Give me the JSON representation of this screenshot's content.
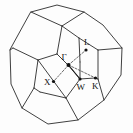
{
  "figure": {
    "name": "brillouin-zone-truncated-octahedron",
    "background_color": "#fdfdfd",
    "line_color": "#2a2a2a",
    "label_color": "#101010",
    "dash_color": "#3a3a3a"
  },
  "symmetry_points": [
    {
      "id": "gamma",
      "label": "Γ",
      "point_x": 68.5,
      "point_y": 65.0,
      "label_x": 61.5,
      "label_y": 60.0
    },
    {
      "id": "L",
      "label": "L",
      "point_x": 86.0,
      "point_y": 50.0,
      "label_x": 84.0,
      "label_y": 45.0
    },
    {
      "id": "X",
      "label": "X",
      "point_x": 53.5,
      "point_y": 81.5,
      "label_x": 44.0,
      "label_y": 84.5
    },
    {
      "id": "W",
      "label": "W",
      "point_x": 80.0,
      "point_y": 79.0,
      "label_x": 76.5,
      "label_y": 89.5
    },
    {
      "id": "K",
      "label": "K",
      "point_x": 95.5,
      "point_y": 78.0,
      "label_x": 92.0,
      "label_y": 89.0
    }
  ],
  "symmetry_segments": [
    {
      "id": "gamma-to-L",
      "from": "gamma",
      "to": "L",
      "style": "dashed"
    },
    {
      "id": "gamma-to-X",
      "from": "gamma",
      "to": "X",
      "style": "dashed"
    },
    {
      "id": "gamma-to-K",
      "from": "gamma",
      "to": "K",
      "style": "dashed"
    },
    {
      "id": "gamma-to-W",
      "from": "gamma",
      "to": "W",
      "style": "solid"
    }
  ],
  "zone_geometry": {
    "type": "truncated-octahedron",
    "outer_silhouette": "31,12 57,5 84,12 103,25 122,48 121,75 104,100 78,120 48,124 22,108 11,84 10,50",
    "faces": [
      {
        "id": "top-square-face",
        "points": "31,12 57,5 84,12 62,26"
      },
      {
        "id": "upper-right-hex-face",
        "points": "84,12 103,25 122,48 98,50 79,38 62,26"
      },
      {
        "id": "upper-left-hex-face",
        "points": "31,12 62,26 57,54 38,60 13,48 10,50"
      },
      {
        "id": "front-top-face",
        "points": "62,26 79,38 80,62 68,65 57,54"
      },
      {
        "id": "right-square-face",
        "points": "122,48 121,75 104,100 98,79 98,50"
      },
      {
        "id": "front-right-hex-face",
        "points": "79,38 98,50 98,79 95,78 80,79 80,62"
      },
      {
        "id": "left-hex-face",
        "points": "10,50 13,48 38,60 34,88 22,108 11,84"
      },
      {
        "id": "front-center-face",
        "points": "38,60 57,54 68,65 80,79 66,98 40,92"
      },
      {
        "id": "bottom-right-face",
        "points": "80,79 95,78 98,79 104,100 78,120 66,98"
      },
      {
        "id": "bottom-left-face",
        "points": "34,88 40,92 66,98 78,120 48,124 22,108"
      }
    ],
    "interior_edges": [
      "31,12 62,26",
      "84,12 62,26",
      "62,26 57,54",
      "57,54 38,60",
      "13,48 38,60",
      "10,50 13,48",
      "38,60 34,88",
      "34,88 22,108",
      "34,88 40,92",
      "40,92 66,98",
      "66,98 78,120",
      "66,98 80,79",
      "62,26 79,38",
      "79,38 98,50",
      "98,50 122,48",
      "98,50 98,79",
      "98,79 104,100",
      "95,78 98,79",
      "80,79 95,78",
      "79,38 80,62",
      "80,62 80,79",
      "57,54 68,65",
      "68,65 80,79",
      "38,60 66,98"
    ]
  }
}
